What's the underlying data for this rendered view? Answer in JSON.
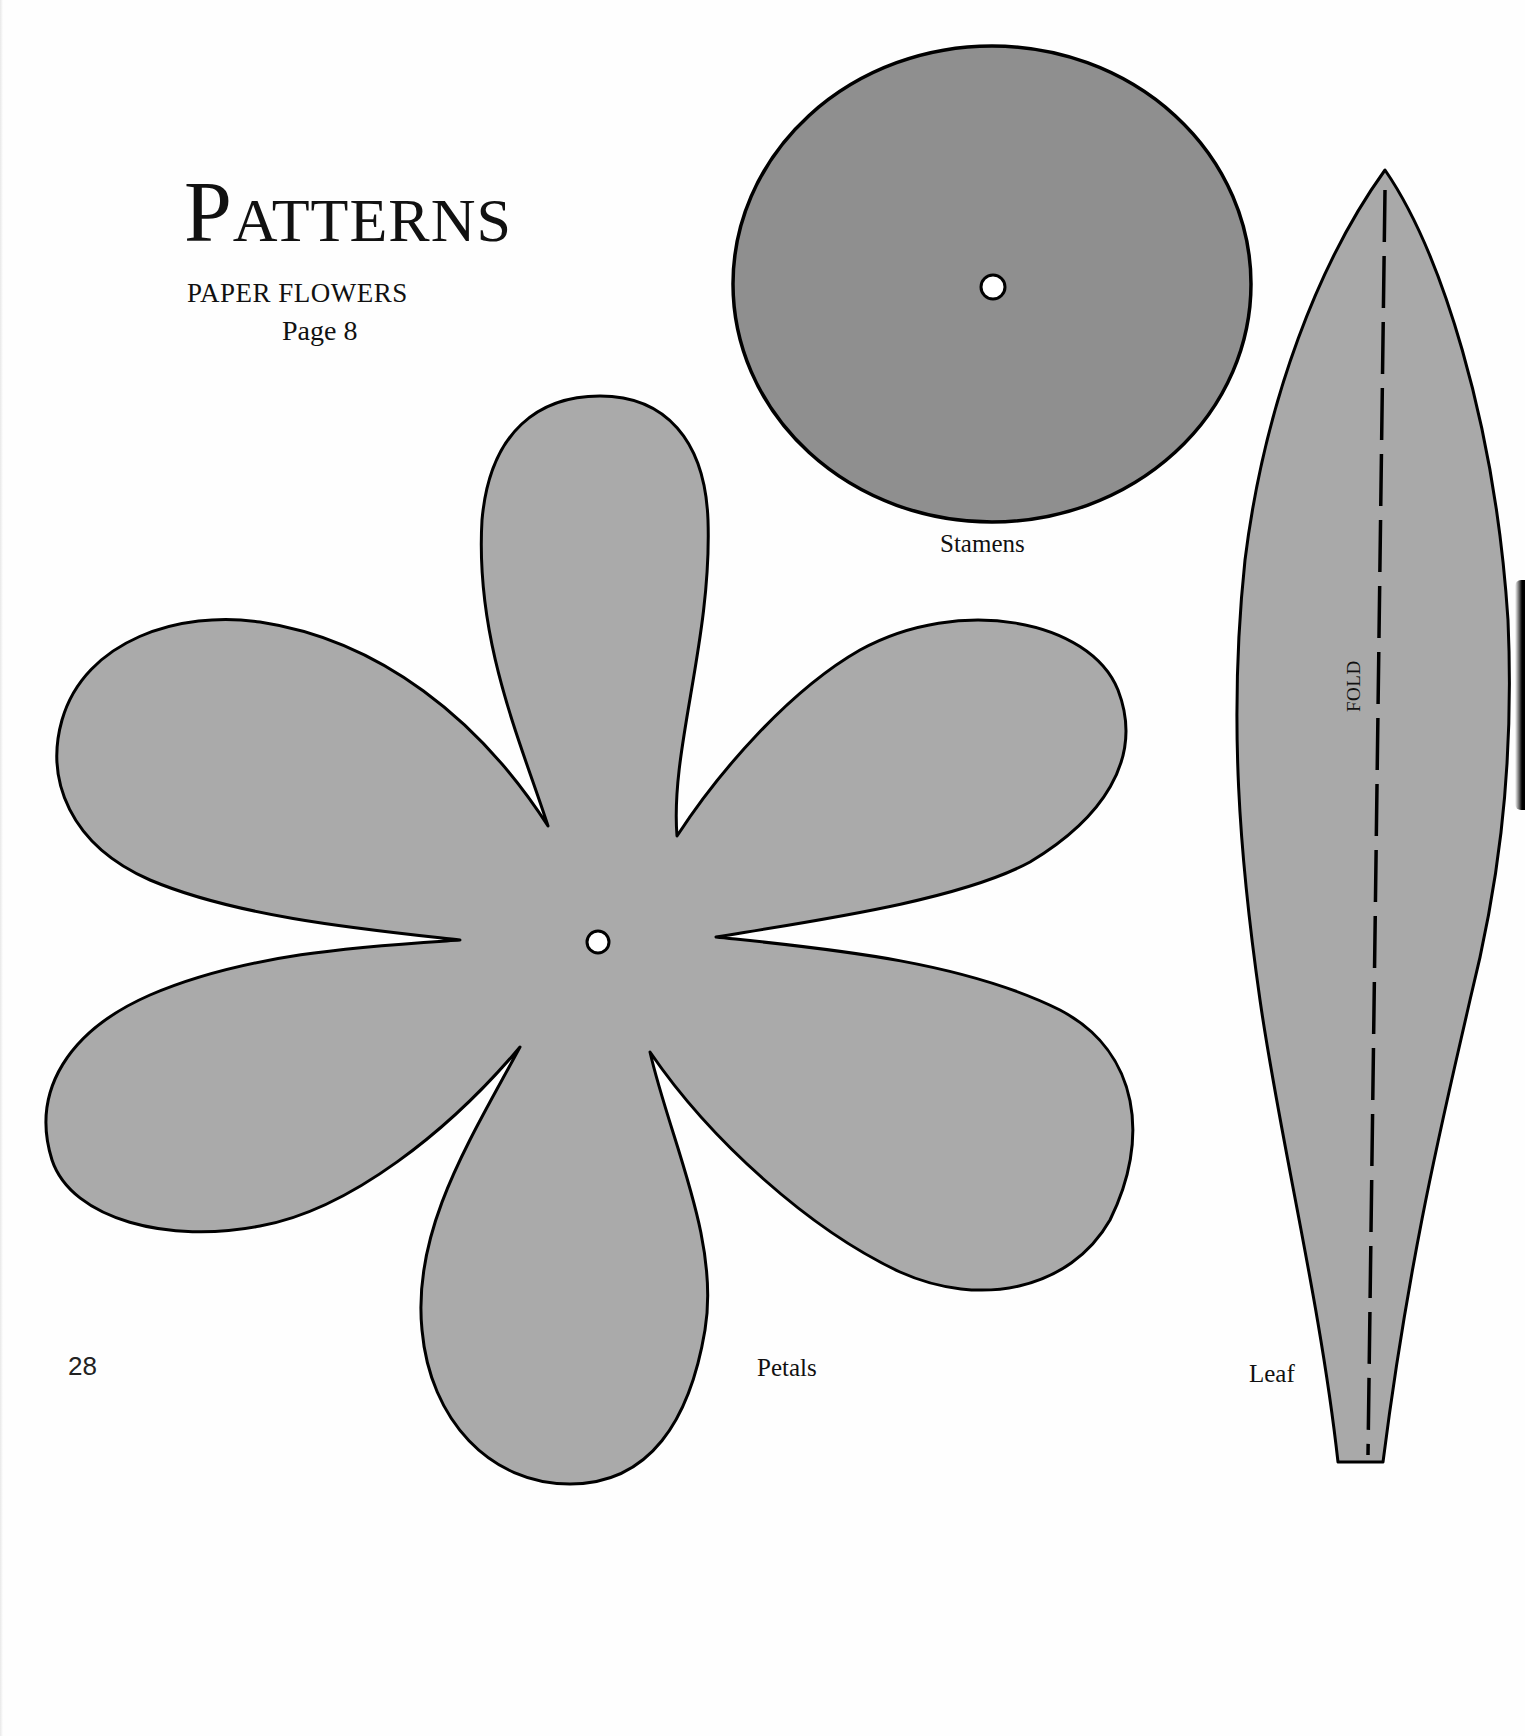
{
  "header": {
    "title": "Patterns",
    "title_first_letter": "P",
    "title_rest": "ATTERNS",
    "subtitle": "PAPER FLOWERS",
    "page_reference": "Page 8"
  },
  "patterns": {
    "stamens": {
      "label": "Stamens",
      "fill": "#8f8f8f"
    },
    "petals": {
      "label": "Petals",
      "fill": "#aaaaaa"
    },
    "leaf": {
      "label": "Leaf",
      "fill": "#a9a9a9",
      "fold_label": "FOLD"
    }
  },
  "colors": {
    "outline": "#000000",
    "page_background": "#fefefe",
    "hole_fill": "#ffffff"
  },
  "footer": {
    "page_number": "28"
  }
}
